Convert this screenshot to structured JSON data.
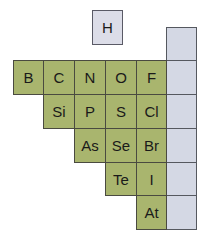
{
  "colors": {
    "nonmetal": "#a9b56e",
    "noble_gas": "#d4d8e4",
    "hydrogen": "#dcdde8"
  },
  "hydrogen": {
    "symbol": "H"
  },
  "rows": [
    {
      "elements": [
        "B",
        "C",
        "N",
        "O",
        "F"
      ],
      "start_col": 0
    },
    {
      "elements": [
        "Si",
        "P",
        "S",
        "Cl"
      ],
      "start_col": 1
    },
    {
      "elements": [
        "As",
        "Se",
        "Br"
      ],
      "start_col": 2
    },
    {
      "elements": [
        "Te",
        "I"
      ],
      "start_col": 3
    },
    {
      "elements": [
        "At"
      ],
      "start_col": 4
    }
  ],
  "noble_gas_column": {
    "cells": 6,
    "labels": [
      "",
      "",
      "",
      "",
      "",
      ""
    ]
  }
}
